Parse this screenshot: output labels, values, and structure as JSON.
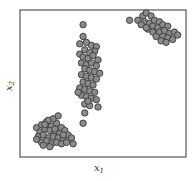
{
  "chart_data": {
    "type": "scatter",
    "title": "",
    "xlabel": "x1",
    "ylabel": "x2",
    "xlim": [
      0,
      10
    ],
    "ylim": [
      0,
      10
    ],
    "grid": false,
    "ticks": false,
    "legend": null,
    "marker": {
      "shape": "circle",
      "fill": "#8a8a8a",
      "edge": "#3a3a3a",
      "radius": 3.2
    },
    "frame_color": "#555555",
    "series": [
      {
        "name": "cluster-bottom-left",
        "points": [
          [
            1.0,
            2.0
          ],
          [
            1.3,
            2.2
          ],
          [
            1.6,
            2.4
          ],
          [
            1.9,
            2.1
          ],
          [
            2.2,
            2.3
          ],
          [
            2.5,
            2.0
          ],
          [
            1.2,
            1.7
          ],
          [
            1.5,
            1.9
          ],
          [
            1.8,
            1.8
          ],
          [
            2.1,
            1.7
          ],
          [
            2.4,
            1.6
          ],
          [
            2.7,
            1.8
          ],
          [
            1.1,
            1.4
          ],
          [
            1.4,
            1.5
          ],
          [
            1.7,
            1.3
          ],
          [
            2.0,
            1.4
          ],
          [
            2.3,
            1.3
          ],
          [
            2.6,
            1.2
          ],
          [
            2.9,
            1.5
          ],
          [
            3.1,
            1.3
          ],
          [
            1.3,
            1.0
          ],
          [
            1.6,
            1.1
          ],
          [
            1.9,
            0.9
          ],
          [
            2.2,
            1.0
          ],
          [
            2.5,
            0.9
          ],
          [
            2.8,
            1.0
          ],
          [
            3.2,
            0.9
          ],
          [
            1.0,
            1.2
          ],
          [
            1.4,
            0.8
          ],
          [
            1.8,
            0.7
          ],
          [
            2.1,
            1.9
          ],
          [
            2.0,
            2.6
          ],
          [
            1.7,
            2.5
          ],
          [
            2.3,
            2.8
          ],
          [
            1.5,
            2.2
          ],
          [
            2.6,
            1.5
          ]
        ]
      },
      {
        "name": "cluster-center",
        "points": [
          [
            3.8,
            9.0
          ],
          [
            3.8,
            8.2
          ],
          [
            3.6,
            7.7
          ],
          [
            4.0,
            7.8
          ],
          [
            4.3,
            7.6
          ],
          [
            4.6,
            7.5
          ],
          [
            4.5,
            7.2
          ],
          [
            3.9,
            7.3
          ],
          [
            4.2,
            7.1
          ],
          [
            3.6,
            7.0
          ],
          [
            3.8,
            6.8
          ],
          [
            4.1,
            6.7
          ],
          [
            4.4,
            6.9
          ],
          [
            4.7,
            6.6
          ],
          [
            3.7,
            6.4
          ],
          [
            4.0,
            6.3
          ],
          [
            4.3,
            6.4
          ],
          [
            4.6,
            6.2
          ],
          [
            3.9,
            6.0
          ],
          [
            4.2,
            5.9
          ],
          [
            4.5,
            5.8
          ],
          [
            4.8,
            5.7
          ],
          [
            3.7,
            5.6
          ],
          [
            4.0,
            5.5
          ],
          [
            4.3,
            5.4
          ],
          [
            4.6,
            5.3
          ],
          [
            3.8,
            5.1
          ],
          [
            4.1,
            5.0
          ],
          [
            4.4,
            4.9
          ],
          [
            3.6,
            4.7
          ],
          [
            3.9,
            4.6
          ],
          [
            4.2,
            4.5
          ],
          [
            4.5,
            4.4
          ],
          [
            3.7,
            4.2
          ],
          [
            4.0,
            4.1
          ],
          [
            4.3,
            4.0
          ],
          [
            4.6,
            3.9
          ],
          [
            3.9,
            3.6
          ],
          [
            4.2,
            3.5
          ],
          [
            4.7,
            3.4
          ],
          [
            3.9,
            3.0
          ],
          [
            3.8,
            2.3
          ],
          [
            3.5,
            4.4
          ],
          [
            4.1,
            3.8
          ]
        ]
      },
      {
        "name": "cluster-top-right",
        "points": [
          [
            6.6,
            9.3
          ],
          [
            7.1,
            9.3
          ],
          [
            7.4,
            9.6
          ],
          [
            7.6,
            9.8
          ],
          [
            7.9,
            9.6
          ],
          [
            7.5,
            9.2
          ],
          [
            7.8,
            9.1
          ],
          [
            8.1,
            9.3
          ],
          [
            8.4,
            9.2
          ],
          [
            8.0,
            8.9
          ],
          [
            8.3,
            8.8
          ],
          [
            8.6,
            9.0
          ],
          [
            8.9,
            8.9
          ],
          [
            7.7,
            8.7
          ],
          [
            8.0,
            8.5
          ],
          [
            8.4,
            8.5
          ],
          [
            8.7,
            8.6
          ],
          [
            9.0,
            8.4
          ],
          [
            9.3,
            8.5
          ],
          [
            8.6,
            8.2
          ],
          [
            8.9,
            8.1
          ],
          [
            9.2,
            8.0
          ],
          [
            8.5,
            7.9
          ],
          [
            8.8,
            7.8
          ],
          [
            7.3,
            9.0
          ],
          [
            7.6,
            8.8
          ],
          [
            9.5,
            8.3
          ],
          [
            8.2,
            8.2
          ]
        ]
      }
    ]
  },
  "axes": {
    "xlabel_main": "x",
    "xlabel_sub": "1",
    "ylabel_main": "x",
    "ylabel_sub": "2"
  }
}
